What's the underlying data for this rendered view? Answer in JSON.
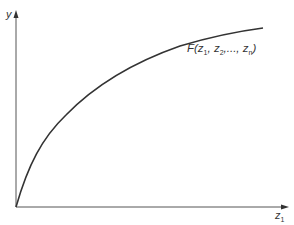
{
  "diagram": {
    "y_axis_label": "y",
    "x_axis_label": "z",
    "x_axis_label_sub": "1",
    "curve_label": {
      "func": "F(z",
      "sub1": "1",
      "mid1": ", z",
      "sub2": "2",
      "mid2": ",..., z",
      "subn": "n",
      "end": ")"
    },
    "colors": {
      "line": "#333333",
      "background": "#ffffff"
    }
  }
}
